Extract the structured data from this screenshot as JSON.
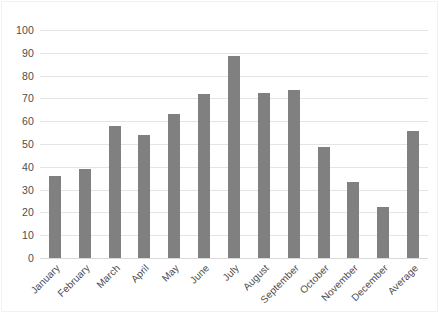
{
  "chart_data": {
    "type": "bar",
    "title": "",
    "subtitle": "",
    "xlabel": "",
    "ylabel": "",
    "ylim": [
      0,
      100
    ],
    "yticks": [
      0,
      10,
      20,
      30,
      40,
      50,
      60,
      70,
      80,
      90,
      100
    ],
    "grid": true,
    "legend": false,
    "legend_position": "none",
    "bar_color": "#808080",
    "gridline_color": "#e4e4e4",
    "axis_text_color": "#4d4d4d",
    "categories": [
      "January",
      "February",
      "March",
      "April",
      "May",
      "June",
      "July",
      "August",
      "September",
      "October",
      "November",
      "December",
      "Average"
    ],
    "values": [
      36,
      39,
      58,
      54,
      63,
      72,
      88.5,
      72.5,
      73.5,
      48.5,
      33.5,
      22.5,
      55.5
    ],
    "annotations": []
  }
}
